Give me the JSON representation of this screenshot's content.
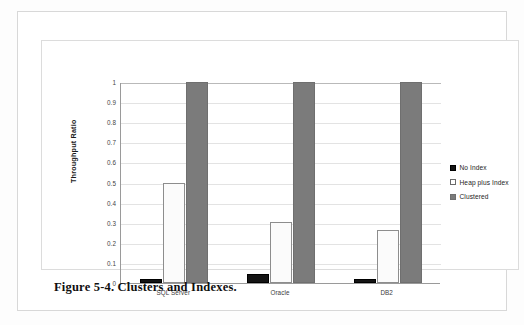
{
  "caption": "Figure 5-4. Clusters and Indexes.",
  "chart_data": {
    "type": "bar",
    "title": "",
    "xlabel": "",
    "ylabel": "Throughput Ratio",
    "categories": [
      "SQL Server",
      "Oracle",
      "DB2"
    ],
    "series": [
      {
        "name": "No Index",
        "values": [
          0.018,
          0.045,
          0.022
        ],
        "color": "#141414"
      },
      {
        "name": "Heap plus Index",
        "values": [
          0.5,
          0.305,
          0.262
        ],
        "color": "#ffffff"
      },
      {
        "name": "Clustered",
        "values": [
          1.0,
          1.0,
          1.0
        ],
        "color": "#7b7b7b"
      }
    ],
    "ylim": [
      0,
      1
    ],
    "yticks": [
      "0",
      "0.1",
      "0.2",
      "0.3",
      "0.4",
      "0.5",
      "0.6",
      "0.7",
      "0.8",
      "0.9",
      "1"
    ],
    "grid": true,
    "legend_position": "right"
  }
}
